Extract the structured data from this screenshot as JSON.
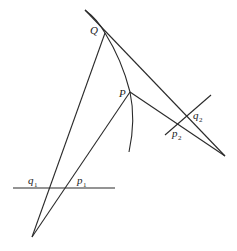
{
  "diagram": {
    "labels": {
      "Q": "Q",
      "P": "P",
      "q2_main": "q",
      "q2_sub": "2",
      "p2_main": "p",
      "p2_sub": "2",
      "q1_main": "q",
      "q1_sub": "1",
      "p1_main": "p",
      "p1_sub": "1"
    },
    "colors": {
      "stroke": "#2a2a2a",
      "background": "#ffffff"
    }
  }
}
